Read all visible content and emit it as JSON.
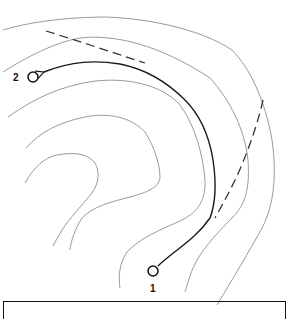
{
  "diagram": {
    "type": "topographic-route-map",
    "points": [
      {
        "id": "start",
        "label": "1",
        "x": 153,
        "y": 271
      },
      {
        "id": "end",
        "label": "2",
        "x": 33,
        "y": 77
      }
    ],
    "colors": {
      "contour": "#9a9a9a",
      "route": "#1a1a1a",
      "dashed": "#333333"
    },
    "legend_box": ""
  }
}
